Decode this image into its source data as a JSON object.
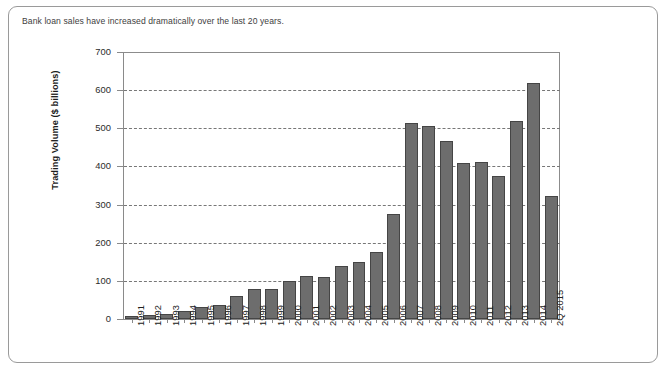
{
  "caption": "Bank loan sales have increased dramatically over the last 20 years.",
  "colors": {
    "bar_fill": "#6d6d6d",
    "bar_stroke": "#454545",
    "axis": "#8a8a8a",
    "grid": "#777777",
    "frame": "#9a9a9a",
    "caption_text": "#3e3e3e"
  },
  "chart_data": {
    "type": "bar",
    "title": "Bank loan sales have increased dramatically over the last 20 years.",
    "xlabel": "",
    "ylabel": "Trading Volume ($ billions)",
    "ylim": [
      0,
      700
    ],
    "yticks": [
      0,
      100,
      200,
      300,
      400,
      500,
      600,
      700
    ],
    "ytick_labels": [
      "0",
      "100",
      "200",
      "300",
      "400",
      "500",
      "600",
      "700"
    ],
    "grid": "horizontal-dashed",
    "legend": "none",
    "categories": [
      "1991",
      "1992",
      "1993",
      "1994",
      "1995",
      "1996",
      "1997",
      "1998",
      "1999",
      "2000",
      "2001",
      "2002",
      "2003",
      "2004",
      "2005",
      "2006",
      "2007",
      "2008",
      "2009",
      "2010",
      "2011",
      "2012",
      "2013",
      "2014",
      "2Q 2015"
    ],
    "values": [
      8,
      10,
      14,
      22,
      32,
      38,
      60,
      78,
      80,
      100,
      112,
      110,
      140,
      150,
      175,
      275,
      515,
      505,
      467,
      410,
      412,
      375,
      520,
      620,
      322
    ]
  }
}
